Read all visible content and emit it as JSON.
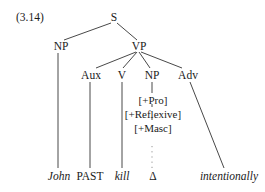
{
  "example_number": "(3.14)",
  "nodes": {
    "S": "S",
    "NP_subject": "NP",
    "VP": "VP",
    "Aux": "Aux",
    "V": "V",
    "NP_object": "NP",
    "Adv": "Adv"
  },
  "features": [
    "[+Pro]",
    "[+Reflexive]",
    "[+Masc]"
  ],
  "leaves": {
    "john": "John",
    "past": "PAST",
    "kill": "kill",
    "delta": "Δ",
    "intentionally": "intentionally"
  }
}
